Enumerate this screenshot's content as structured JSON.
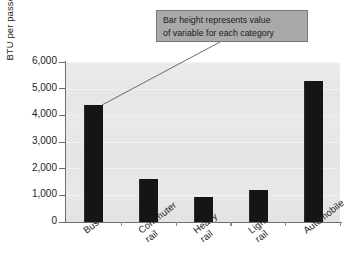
{
  "chart_data": {
    "type": "bar",
    "title": "",
    "xlabel": "",
    "ylabel": "BTU per passenger-mile",
    "categories": [
      "Bus",
      "Commuter rail",
      "Heavy rail",
      "Light rail",
      "Automobile"
    ],
    "category_lines": [
      [
        "Bus"
      ],
      [
        "Commuter",
        "rail"
      ],
      [
        "Heavy",
        "rail"
      ],
      [
        "Light",
        "rail"
      ],
      [
        "Automobile"
      ]
    ],
    "values": [
      4400,
      1600,
      950,
      1200,
      5300
    ],
    "ylim": [
      0,
      6000
    ],
    "ytick_values": [
      0,
      1000,
      2000,
      3000,
      4000,
      5000,
      6000
    ],
    "ytick_labels": [
      "0",
      "1,000",
      "2,000",
      "3,000",
      "4,000",
      "5,000",
      "6,000"
    ],
    "grid": false,
    "legend": "none",
    "bar_color": "#151515",
    "plot_background": "#e7e7e7",
    "axis_color": "#6d6d6d"
  },
  "annotation": {
    "lines": [
      "Bar height represents value",
      "of variable for each category"
    ],
    "box_fill": "#a9a9a9",
    "box_border": "#767676",
    "leader_target": "bus-bar-top"
  }
}
